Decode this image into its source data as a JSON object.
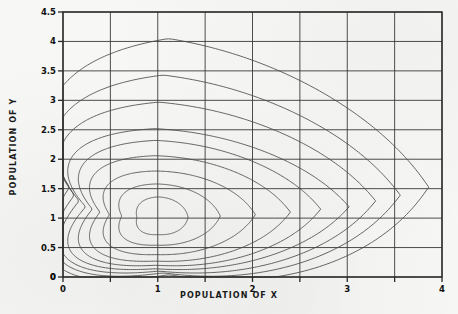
{
  "chart_data": {
    "type": "line",
    "title": "",
    "subtitle": "",
    "xlabel": "POPULATION OF X",
    "ylabel": "POPULATION OF Y",
    "xlim": [
      0,
      4
    ],
    "ylim": [
      0,
      4.5
    ],
    "xticks": [
      "0",
      "1",
      "2",
      "3",
      "4"
    ],
    "xtick_values": [
      0,
      1,
      2,
      3,
      4
    ],
    "xminor_step": 0.5,
    "yticks": [
      "0",
      "0.5",
      "1",
      "1.5",
      "2",
      "2.5",
      "3",
      "3.5",
      "4",
      "4.5"
    ],
    "ytick_values": [
      0,
      0.5,
      1,
      1.5,
      2,
      2.5,
      3,
      3.5,
      4,
      4.5
    ],
    "grid": true,
    "grid_color": "#3a3a3a",
    "frame_color": "#2a2a2a",
    "curve_color": "#4a4a4a",
    "background": "#f7f7f5",
    "legend": [],
    "annotations": [],
    "equilibrium": {
      "x": 1,
      "y": 1
    },
    "series": [
      {
        "name": "orbit-1",
        "level": 1,
        "x_range": [
          0.78,
          1.32
        ],
        "y_range": [
          0.72,
          1.36
        ],
        "peak": {
          "x": 1.0,
          "y": 1.36
        },
        "trough": {
          "x": 1.0,
          "y": 0.72
        },
        "x_min_point": {
          "x": 0.78,
          "y": 1.0
        },
        "x_max_point": {
          "x": 1.32,
          "y": 1.0
        }
      },
      {
        "name": "orbit-2",
        "level": 2,
        "x_range": [
          0.62,
          1.66
        ],
        "y_range": [
          0.54,
          1.58
        ],
        "peak": {
          "x": 0.97,
          "y": 1.58
        },
        "trough": {
          "x": 1.03,
          "y": 0.54
        },
        "x_min_point": {
          "x": 0.62,
          "y": 1.02
        },
        "x_max_point": {
          "x": 1.66,
          "y": 1.02
        }
      },
      {
        "name": "orbit-3",
        "level": 3,
        "x_range": [
          0.49,
          2.03
        ],
        "y_range": [
          0.38,
          1.8
        ],
        "peak": {
          "x": 0.95,
          "y": 1.8
        },
        "trough": {
          "x": 1.06,
          "y": 0.38
        },
        "x_min_point": {
          "x": 0.49,
          "y": 1.04
        },
        "x_max_point": {
          "x": 2.03,
          "y": 1.04
        }
      },
      {
        "name": "orbit-4",
        "level": 4,
        "x_range": [
          0.39,
          2.4
        ],
        "y_range": [
          0.27,
          2.06
        ],
        "peak": {
          "x": 0.93,
          "y": 2.06
        },
        "trough": {
          "x": 1.1,
          "y": 0.27
        },
        "x_min_point": {
          "x": 0.39,
          "y": 1.06
        },
        "x_max_point": {
          "x": 2.4,
          "y": 1.06
        }
      },
      {
        "name": "orbit-5",
        "level": 5,
        "x_range": [
          0.31,
          2.72
        ],
        "y_range": [
          0.2,
          2.32
        ],
        "peak": {
          "x": 0.92,
          "y": 2.32
        },
        "trough": {
          "x": 1.13,
          "y": 0.2
        },
        "x_min_point": {
          "x": 0.31,
          "y": 1.08
        },
        "x_max_point": {
          "x": 2.72,
          "y": 1.08
        }
      },
      {
        "name": "orbit-6",
        "level": 6,
        "x_range": [
          0.24,
          3.02
        ],
        "y_range": [
          0.14,
          2.52
        ],
        "peak": {
          "x": 0.9,
          "y": 2.52
        },
        "trough": {
          "x": 1.16,
          "y": 0.14
        },
        "x_min_point": {
          "x": 0.24,
          "y": 1.1
        },
        "x_max_point": {
          "x": 3.02,
          "y": 1.1
        }
      },
      {
        "name": "orbit-7",
        "level": 7,
        "x_range": [
          0.17,
          3.3
        ],
        "y_range": [
          0.1,
          2.97
        ],
        "peak": {
          "x": 0.93,
          "y": 2.97
        },
        "trough": {
          "x": 1.2,
          "y": 0.1
        },
        "x_min_point": {
          "x": 0.17,
          "y": 1.13
        },
        "x_max_point": {
          "x": 3.3,
          "y": 1.13
        }
      },
      {
        "name": "orbit-8",
        "level": 8,
        "x_range": [
          0.12,
          3.56
        ],
        "y_range": [
          0.07,
          3.43
        ],
        "peak": {
          "x": 0.97,
          "y": 3.43
        },
        "trough": {
          "x": 1.24,
          "y": 0.07
        },
        "x_min_point": {
          "x": 0.12,
          "y": 1.15
        },
        "x_max_point": {
          "x": 3.56,
          "y": 1.15
        }
      },
      {
        "name": "orbit-9",
        "level": 9,
        "x_range": [
          0.07,
          3.86
        ],
        "y_range": [
          0.04,
          4.05
        ],
        "peak": {
          "x": 1.02,
          "y": 4.05
        },
        "trough": {
          "x": 1.28,
          "y": 0.04
        },
        "x_min_point": {
          "x": 0.07,
          "y": 1.18
        },
        "x_max_point": {
          "x": 3.86,
          "y": 1.18
        }
      }
    ]
  }
}
